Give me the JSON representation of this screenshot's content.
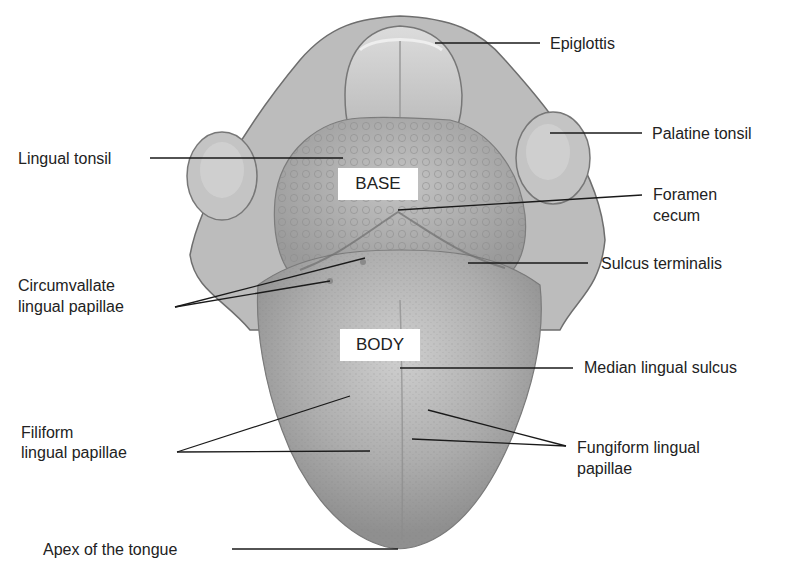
{
  "figure": {
    "regions": {
      "base": "BASE",
      "body": "BODY"
    },
    "labels": {
      "epiglottis": "Epiglottis",
      "palatine_tonsil": "Palatine tonsil",
      "lingual_tonsil": "Lingual tonsil",
      "foramen_cecum_line1": "Foramen",
      "foramen_cecum_line2": "cecum",
      "sulcus_terminalis": "Sulcus terminalis",
      "circumvallate_line1": "Circumvallate",
      "circumvallate_line2": "lingual papillae",
      "median_lingual_sulcus": "Median lingual sulcus",
      "filiform_line1": "Filiform",
      "filiform_line2": "lingual papillae",
      "fungiform_line1": "Fungiform lingual",
      "fungiform_line2": "papillae",
      "apex": "Apex of the tongue"
    },
    "colors": {
      "background": "#ffffff",
      "tongue_fill": "#a8a8a8",
      "tongue_light": "#c9c9c9",
      "outline": "#6e6e6e",
      "leader_line": "#1a1a1a",
      "text": "#222222"
    }
  }
}
